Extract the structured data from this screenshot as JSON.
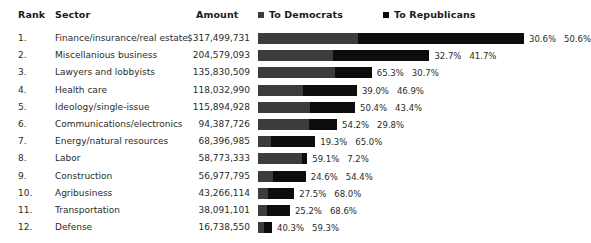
{
  "table": {
    "headers": {
      "rank": "Rank",
      "sector": "Sector",
      "amount": "Amount"
    }
  },
  "legend": {
    "democrats": {
      "label": "To Democrats",
      "color": "#3c3c3c",
      "swatch_icon": "square-marker-icon"
    },
    "republicans": {
      "label": "To Republicans",
      "color": "#0d0d0d",
      "swatch_icon": "square-marker-icon"
    }
  },
  "chart_data": {
    "type": "bar",
    "title": "",
    "subtitle": "",
    "xlabel": "",
    "ylabel": "",
    "orientation": "horizontal",
    "stacked": true,
    "grid": false,
    "legend_position": "top-right",
    "bar_scale": "absolute-amount",
    "max_amount": 317499731,
    "max_bar_px": 266,
    "categories": [
      "Finance/insurance/real estate",
      "Miscellanious business",
      "Lawyers and lobbyists",
      "Health care",
      "Ideology/single-issue",
      "Communications/electronics",
      "Energy/natural resources",
      "Labor",
      "Construction",
      "Agribusiness",
      "Transportation",
      "Defense"
    ],
    "ranks": [
      "1.",
      "2.",
      "3.",
      "4.",
      "5.",
      "6.",
      "7.",
      "8.",
      "9.",
      "10.",
      "11.",
      "12."
    ],
    "amounts": [
      "$317,499,731",
      "204,579,093",
      "135,830,509",
      "118,032,990",
      "115,894,928",
      "94,387,726",
      "68,396,985",
      "58,773,333",
      "56,977,795",
      "43,266,114",
      "38,091,101",
      "16,738,550"
    ],
    "amounts_numeric": [
      317499731,
      204579093,
      135830509,
      118032990,
      115894928,
      94387726,
      68396985,
      58773333,
      56977795,
      43266114,
      38091101,
      16738550
    ],
    "series": [
      {
        "name": "To Democrats",
        "color": "#3c3c3c",
        "values": [
          30.6,
          32.7,
          65.3,
          39.0,
          50.4,
          54.2,
          19.3,
          59.1,
          24.6,
          27.5,
          25.2,
          40.3
        ],
        "labels": [
          "30.6%",
          "32.7%",
          "65.3%",
          "39.0%",
          "50.4%",
          "54.2%",
          "19.3%",
          "59.1%",
          "24.6%",
          "27.5%",
          "25.2%",
          "40.3%"
        ]
      },
      {
        "name": "To Republicans",
        "color": "#0d0d0d",
        "values": [
          50.6,
          41.7,
          30.7,
          46.9,
          43.4,
          29.8,
          65.0,
          7.2,
          54.4,
          68.0,
          68.6,
          59.3
        ],
        "labels": [
          "50.6%",
          "41.7%",
          "30.7%",
          "46.9%",
          "43.4%",
          "29.8%",
          "65.0%",
          "7.2%",
          "54.4%",
          "68.0%",
          "68.6%",
          "59.3%"
        ]
      }
    ]
  }
}
